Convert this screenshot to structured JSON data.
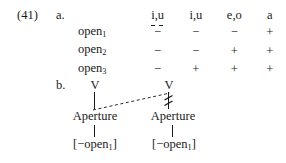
{
  "figure": {
    "example_number": "(41)",
    "part_a_label": "a.",
    "part_b_label": "b."
  },
  "matrix": {
    "column_headers": [
      "i̯,u̯",
      "i,u",
      "e,o",
      "a"
    ],
    "column_headers_plain": [
      "i,u",
      "i,u",
      "e,o",
      "a"
    ],
    "row_labels": [
      "open",
      "open",
      "open"
    ],
    "row_subscripts": [
      "1",
      "2",
      "3"
    ],
    "rows": [
      {
        "label": "open",
        "subscript": "1",
        "values": [
          "−",
          "−",
          "−",
          "+"
        ]
      },
      {
        "label": "open",
        "subscript": "2",
        "values": [
          "−",
          "−",
          "+",
          "+"
        ]
      },
      {
        "label": "open",
        "subscript": "3",
        "values": [
          "−",
          "+",
          "+",
          "+"
        ]
      }
    ]
  },
  "tree": {
    "left_branch": {
      "root": "V",
      "class_node": "Aperture",
      "feature": "[−open",
      "feature_subscript": "1",
      "feature_close": "]"
    },
    "right_branch": {
      "root": "V",
      "class_node": "Aperture",
      "feature": "[−open",
      "feature_subscript": "1",
      "feature_close": "]"
    },
    "annotations": {
      "dashed_line": "re-association line",
      "delink_mark": "delinking double-strike"
    }
  },
  "colors": {
    "ink": "#1a1a1a",
    "paper": "#ffffff",
    "dashed": "#2a2a2a"
  }
}
